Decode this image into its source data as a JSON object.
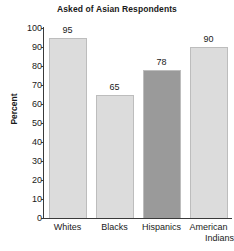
{
  "chart_data": {
    "type": "bar",
    "title": "Asked of Asian Respondents",
    "xlabel": "",
    "ylabel": "Percent",
    "ylim": [
      0,
      100
    ],
    "ytick_step": 10,
    "yticks": [
      "100",
      "90",
      "80",
      "70",
      "60",
      "50",
      "40",
      "30",
      "20",
      "10",
      "0"
    ],
    "grid": false,
    "legend": "none",
    "categories": [
      "Whites",
      "Blacks",
      "Hispanics",
      "American Indians"
    ],
    "values": [
      95,
      65,
      78,
      90
    ],
    "value_labels": [
      "95",
      "65",
      "78",
      "90"
    ],
    "bar_colors": [
      "#dcdcdc",
      "#dcdcdc",
      "#9a9a9a",
      "#dcdcdc"
    ],
    "bar_border_color": "#bdbdbd"
  },
  "category_label_lines": [
    [
      "Whites"
    ],
    [
      "Blacks"
    ],
    [
      "Hispanics"
    ],
    [
      "American",
      "Indians"
    ]
  ]
}
